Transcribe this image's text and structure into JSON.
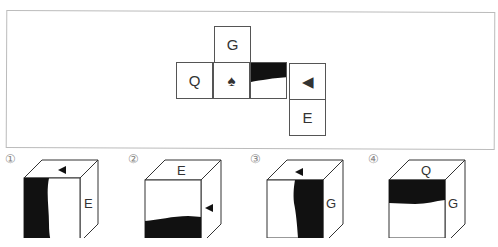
{
  "question": {
    "faded_header": "",
    "net": {
      "cells": [
        {
          "id": "top",
          "label": "G",
          "x": 214,
          "y": 26
        },
        {
          "id": "left",
          "label": "Q",
          "x": 176,
          "y": 62
        },
        {
          "id": "center",
          "label": "♠",
          "x": 214,
          "y": 62
        },
        {
          "id": "black",
          "label": "",
          "x": 251,
          "y": 62
        },
        {
          "id": "right",
          "label": "◀",
          "x": 289,
          "y": 62
        },
        {
          "id": "bottom",
          "label": "E",
          "x": 289,
          "y": 99
        }
      ]
    },
    "options": [
      {
        "num": "①",
        "top": "◀",
        "side": "E",
        "shade": "left-vertical"
      },
      {
        "num": "②",
        "top": "E",
        "side": "◀",
        "shade": "bottom-horizontal"
      },
      {
        "num": "③",
        "top": "◀",
        "side": "G",
        "shade": "right-vertical"
      },
      {
        "num": "④",
        "top": "Q",
        "side": "G",
        "shade": "top-horizontal"
      }
    ]
  }
}
